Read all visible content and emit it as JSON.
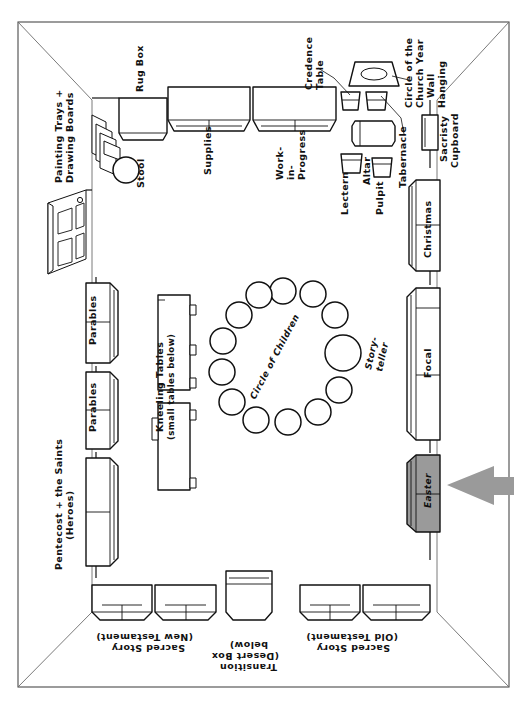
{
  "diagram": {
    "type": "room-floor-plan",
    "accent_highlight_color": "#9a9a9a",
    "line_color": "#111111",
    "background_color": "#ffffff"
  },
  "labels": {
    "painting_trays": "Painting Trays +\nDrawing Boards",
    "painting_trays_l1": "Painting Trays +",
    "painting_trays_l2": "Drawing Boards",
    "stool": "Stool",
    "rug_box": "Rug Box",
    "supplies": "Supplies",
    "work_in_progress_l1": "Work-",
    "work_in_progress_l2": "in-",
    "work_in_progress_l3": "Progress",
    "credence_table_l1": "Credence",
    "credence_table_l2": "Table",
    "church_year_l1": "Circle of the",
    "church_year_l2": "Church Year",
    "church_year_l3": "Wall",
    "church_year_l4": "Hanging",
    "sacristy_l1": "Sacristy",
    "sacristy_l2": "Cupboard",
    "lectern": "Lectern",
    "altar": "Altar",
    "pulpit": "Pulpit",
    "tabernacle": "Tabernacle",
    "christmas": "Christmas",
    "focal": "Focal",
    "easter": "Easter",
    "parables_upper": "Parables",
    "parables_lower": "Parables",
    "pentecost_l1": "Pentecost + the Saints",
    "pentecost_l2": "(Heroes)",
    "kneeling_l1": "Kneeling Tables",
    "kneeling_l2": "(small tables below)",
    "circle_of_children": "Circle of Children",
    "storyteller_l1": "Story-",
    "storyteller_l2": "teller",
    "sacred_story_nt_l1": "Sacred Story",
    "sacred_story_nt_l2": "(New Testament)",
    "transition_l1": "Transition",
    "transition_l2": "(Desert Box",
    "transition_l3": "below)",
    "sacred_story_ot_l1": "Sacred Story",
    "sacred_story_ot_l2": "(Old Testament)"
  },
  "children_circle": {
    "seat_count": 12,
    "storyteller_count": 1
  }
}
